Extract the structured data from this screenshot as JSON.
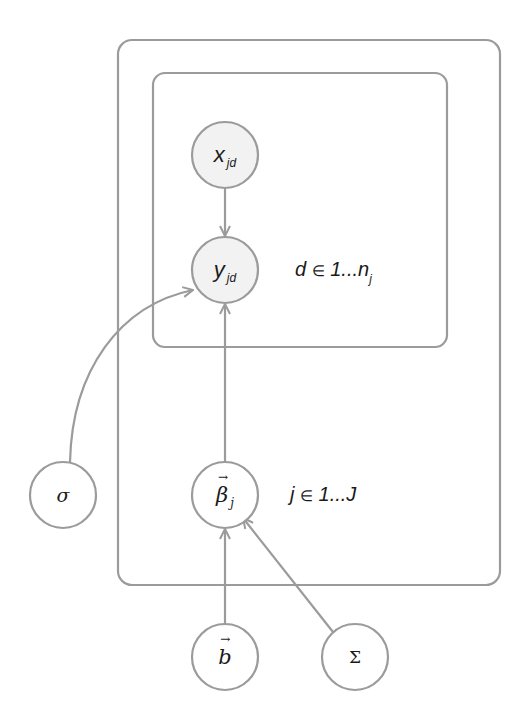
{
  "diagram": {
    "type": "plate-notation graphical model",
    "colors": {
      "stroke": "#9b9b9b",
      "observed_fill": "#f2f2f2",
      "latent_fill": "#ffffff",
      "text": "#1a1a1a"
    },
    "plates": [
      {
        "id": "outer",
        "index_var": "j",
        "label_var": "j",
        "label_in": "∈",
        "label_range": "1...J"
      },
      {
        "id": "inner",
        "index_var": "d",
        "label_var": "d",
        "label_in": "∈",
        "label_range": "1...n",
        "label_range_sub": "j"
      }
    ],
    "nodes": [
      {
        "id": "x_jd",
        "symbol": "x",
        "subscript": "jd",
        "observed": true,
        "plate": "inner"
      },
      {
        "id": "y_jd",
        "symbol": "y",
        "subscript": "jd",
        "observed": true,
        "plate": "inner"
      },
      {
        "id": "beta_j",
        "symbol": "β",
        "subscript": "j",
        "vector": true,
        "observed": false,
        "plate": "outer"
      },
      {
        "id": "sigma",
        "symbol": "σ",
        "observed": false
      },
      {
        "id": "b",
        "symbol": "b",
        "vector": true,
        "observed": false
      },
      {
        "id": "Sigma",
        "symbol": "Σ",
        "observed": false
      }
    ],
    "edges": [
      {
        "from": "x_jd",
        "to": "y_jd"
      },
      {
        "from": "beta_j",
        "to": "y_jd"
      },
      {
        "from": "sigma",
        "to": "y_jd"
      },
      {
        "from": "b",
        "to": "beta_j"
      },
      {
        "from": "Sigma",
        "to": "beta_j"
      }
    ]
  }
}
